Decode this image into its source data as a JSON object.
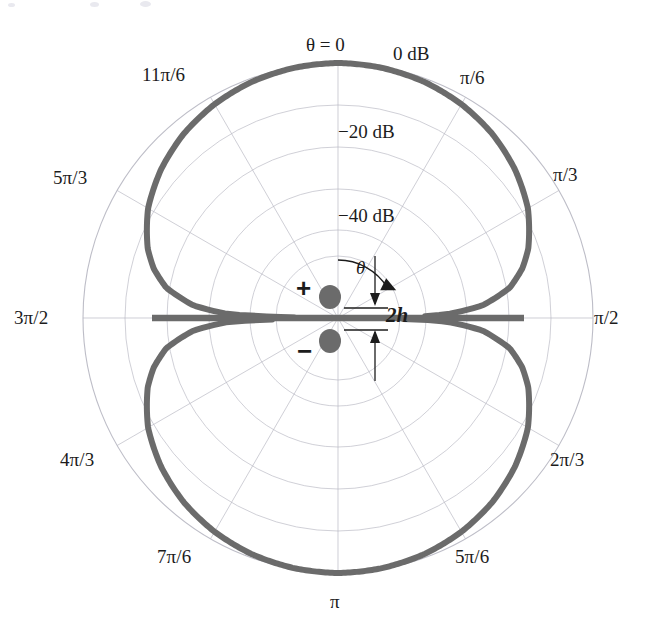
{
  "figure": {
    "kind": "polar-radiation-pattern",
    "background_color": "#ffffff",
    "curve_color": "#6b6b6b",
    "grid_color": "#b9b9c4",
    "text_color": "#1c1c1c",
    "marker_color": "#6b6b6b"
  },
  "center": {
    "x": 338,
    "y": 318
  },
  "radius_px": 255,
  "angle_labels": [
    {
      "name": "theta-zero",
      "text": "θ = 0",
      "angle_rad": 0,
      "x": 306,
      "y": 35
    },
    {
      "name": "pi-over-6",
      "text": "π/6",
      "angle_rad": 0.5236,
      "x": 460,
      "y": 68
    },
    {
      "name": "pi-over-3",
      "text": "π/3",
      "angle_rad": 1.0472,
      "x": 553,
      "y": 165
    },
    {
      "name": "pi-over-2",
      "text": "π/2",
      "angle_rad": 1.5708,
      "x": 594,
      "y": 308
    },
    {
      "name": "two-pi-over-3",
      "text": "2π/3",
      "angle_rad": 2.0944,
      "x": 550,
      "y": 450
    },
    {
      "name": "five-pi-over-6",
      "text": "5π/6",
      "angle_rad": 2.618,
      "x": 455,
      "y": 547
    },
    {
      "name": "pi",
      "text": "π",
      "angle_rad": 3.1416,
      "x": 330,
      "y": 592
    },
    {
      "name": "seven-pi-over-6",
      "text": "7π/6",
      "angle_rad": 3.6652,
      "x": 157,
      "y": 547
    },
    {
      "name": "four-pi-over-3",
      "text": "4π/3",
      "angle_rad": 4.1888,
      "x": 60,
      "y": 450
    },
    {
      "name": "three-pi-over-2",
      "text": "3π/2",
      "angle_rad": 4.7124,
      "x": 14,
      "y": 308
    },
    {
      "name": "five-pi-over-3",
      "text": "5π/3",
      "angle_rad": 5.236,
      "x": 53,
      "y": 168
    },
    {
      "name": "eleven-pi-over-6",
      "text": "11π/6",
      "angle_rad": 5.7596,
      "x": 142,
      "y": 65
    }
  ],
  "radial_labels": [
    {
      "name": "zero-db",
      "text": "0 dB",
      "value_db": 0,
      "radius_px": 255,
      "x": 393,
      "y": 44
    },
    {
      "name": "minus-20-db",
      "text": "−20 dB",
      "value_db": -20,
      "radius_px": 171,
      "x": 338,
      "y": 122
    },
    {
      "name": "minus-40-db",
      "text": "−40 dB",
      "value_db": -40,
      "radius_px": 88,
      "x": 338,
      "y": 206
    }
  ],
  "grid": {
    "ring_radii_px": [
      255,
      213,
      171,
      129,
      88,
      62
    ],
    "ring_labeled": [
      true,
      false,
      true,
      false,
      true,
      false
    ],
    "spoke_count": 12,
    "spoke_step_rad": 0.5236
  },
  "annotations": {
    "plus_marker": {
      "name": "plus-sign",
      "text": "+",
      "x": 296,
      "y": 275
    },
    "minus_marker": {
      "name": "minus-sign",
      "text": "−",
      "x": 297,
      "y": 338
    },
    "theta_symbol": {
      "name": "theta-symbol",
      "text": "θ",
      "x": 356,
      "y": 258
    },
    "spacing_label": {
      "name": "spacing-2h-label",
      "text": "2h",
      "x": 386,
      "y": 305
    },
    "dipole_top": {
      "name": "dipole-element-positive",
      "cx": 330,
      "cy": 297,
      "r": 11
    },
    "dipole_bottom": {
      "name": "dipole-element-negative",
      "cx": 330,
      "cy": 341,
      "r": 11
    }
  },
  "chart_data": {
    "type": "line",
    "subtype": "polar",
    "title": "",
    "xlabel": "",
    "ylabel": "",
    "r_unit": "dB",
    "rlim": [
      -50,
      0
    ],
    "r_ticks": [
      0,
      -20,
      -40
    ],
    "r_tick_labels": [
      "0 dB",
      "−20 dB",
      "−40 dB"
    ],
    "theta_ticks_rad": [
      0,
      0.5236,
      1.0472,
      1.5708,
      2.0944,
      2.618,
      3.1416,
      3.6652,
      4.1888,
      4.7124,
      5.236,
      5.7596
    ],
    "theta_tick_labels": [
      "θ = 0",
      "π/6",
      "π/3",
      "π/2",
      "2π/3",
      "5π/6",
      "π",
      "7π/6",
      "4π/3",
      "3π/2",
      "5π/3",
      "11π/6"
    ],
    "theta_zero_location": "N",
    "theta_direction": "clockwise",
    "grid": true,
    "legend": false,
    "series": [
      {
        "name": "two-element-dipole-pattern",
        "color": "#6b6b6b",
        "line_width_px": 6,
        "description": "Normalized power pattern of a vertically stacked pair of out-of-phase elements separated by 2h; maxima at theta = 0 and theta = pi (0 dB), deep nulls at theta = pi/2 and 3pi/2",
        "theta_deg": [
          0,
          10,
          20,
          30,
          40,
          50,
          60,
          70,
          75,
          80,
          85,
          88,
          89,
          90,
          91,
          92,
          95,
          100,
          105,
          110,
          120,
          130,
          140,
          150,
          160,
          170,
          180,
          190,
          200,
          210,
          220,
          230,
          240,
          250,
          255,
          260,
          265,
          268,
          270,
          272,
          275,
          280,
          285,
          290,
          300,
          310,
          320,
          330,
          340,
          350,
          360
        ],
        "r_db": [
          0,
          -0.2,
          -0.7,
          -1.6,
          -2.9,
          -4.7,
          -7.0,
          -10.3,
          -12.6,
          -15.8,
          -21.5,
          -28.5,
          -34.0,
          -50,
          -34.0,
          -28.5,
          -21.5,
          -15.8,
          -12.6,
          -10.3,
          -7.0,
          -4.7,
          -2.9,
          -1.6,
          -0.7,
          -0.2,
          0,
          -0.2,
          -0.7,
          -1.6,
          -2.9,
          -4.7,
          -7.0,
          -10.3,
          -12.6,
          -15.8,
          -21.5,
          -28.5,
          -50,
          -28.5,
          -21.5,
          -15.8,
          -12.6,
          -10.3,
          -7.0,
          -4.7,
          -2.9,
          -1.6,
          -0.7,
          -0.2,
          0
        ]
      }
    ]
  }
}
